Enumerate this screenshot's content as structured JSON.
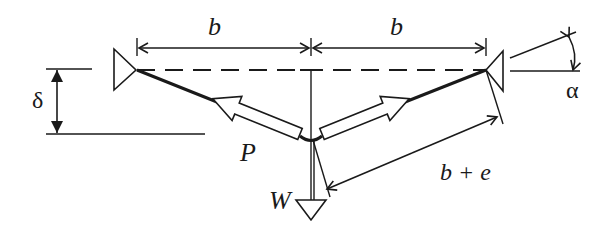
{
  "figure": {
    "type": "mechanics free-body diagram",
    "stroke_color": "#1a1a1a",
    "background": "#ffffff"
  },
  "labels": {
    "span_left": "b",
    "span_right": "b",
    "sag": "δ",
    "angle": "α",
    "tension": "P",
    "load": "W",
    "stretched_length": "b + e"
  },
  "elements": {
    "pulleys": [
      "left-pulley",
      "right-pulley"
    ],
    "dimensions": [
      "span-left-b",
      "span-right-b",
      "sag-delta",
      "stretched-length-b-plus-e",
      "angle-alpha"
    ],
    "force_arrows": [
      "tension-arrow-left-P",
      "tension-arrow-right",
      "load-arrow-W"
    ]
  }
}
